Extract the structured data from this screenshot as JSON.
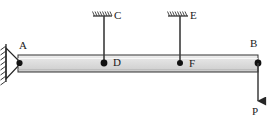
{
  "diagram": {
    "type": "structural-beam-free-body-diagram",
    "background_color": "#ffffff",
    "line_color": "#262626",
    "beam_fill_color": "#d9d9d9",
    "beam_edge_color": "#333333",
    "labels": {
      "a": "A",
      "b": "B",
      "c": "C",
      "d": "D",
      "e": "E",
      "f": "F",
      "p": "P"
    },
    "beam": {
      "x_start": 18,
      "x_end": 258,
      "y_top": 55,
      "y_bottom": 72
    },
    "supports": [
      {
        "name": "pin-support-A",
        "label": "A",
        "kind": "pin",
        "x": 18,
        "y": 63,
        "wall_x": 6,
        "wall_y_top": 44,
        "wall_y_bottom": 82
      },
      {
        "name": "ceiling-hanger-C",
        "label": "C",
        "kind": "fixed-ceiling-hatch",
        "x": 104,
        "y": 16,
        "hatch_x_start": 93,
        "hatch_x_end": 112
      },
      {
        "name": "ceiling-hanger-E",
        "label": "E",
        "kind": "fixed-ceiling-hatch",
        "x": 180,
        "y": 16,
        "hatch_x_start": 168,
        "hatch_x_end": 188
      }
    ],
    "nodes": [
      {
        "name": "node-D",
        "label": "D",
        "x": 104,
        "y": 63
      },
      {
        "name": "node-F",
        "label": "F",
        "x": 180,
        "y": 63
      },
      {
        "name": "node-B",
        "label": "B",
        "x": 258,
        "y": 63
      }
    ],
    "members": [
      {
        "name": "hanger-C-D",
        "x": 104,
        "y_top": 16,
        "y_bottom": 63
      },
      {
        "name": "hanger-E-F",
        "x": 180,
        "y_top": 16,
        "y_bottom": 63
      }
    ],
    "loads": [
      {
        "name": "point-load-P",
        "label": "P",
        "direction": "down",
        "x": 258,
        "y_start": 63,
        "y_end": 103
      }
    ]
  }
}
